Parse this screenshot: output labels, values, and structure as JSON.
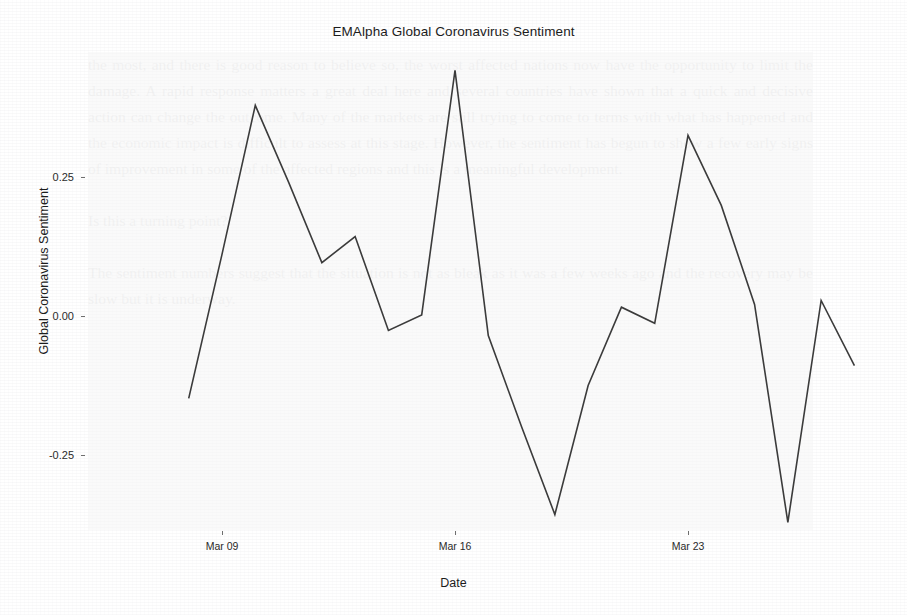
{
  "chart_data": {
    "type": "line",
    "title": "EMAlpha Global Coronavirus Sentiment",
    "xlabel": "Date",
    "ylabel": "Global Coronavirus Sentiment",
    "grid": false,
    "legend": "none",
    "line_color": "#3b3b3b",
    "x_tick_labels": [
      "Mar 09",
      "Mar 16",
      "Mar 23"
    ],
    "y_tick_labels": [
      "0.25",
      "0.00",
      "-0.25"
    ],
    "y_tick_values": [
      0.25,
      0.0,
      -0.25
    ],
    "ylim": [
      -0.43,
      0.49
    ],
    "xlim": [
      "Mar 08",
      "Mar 27"
    ],
    "x": [
      "Mar 08",
      "Mar 09",
      "Mar 10",
      "Mar 11",
      "Mar 12",
      "Mar 13",
      "Mar 14",
      "Mar 15",
      "Mar 16",
      "Mar 17",
      "Mar 18",
      "Mar 19",
      "Mar 20",
      "Mar 21",
      "Mar 22",
      "Mar 23",
      "Mar 24",
      "Mar 25",
      "Mar 26",
      "Mar 27"
    ],
    "values": [
      -0.149,
      0.11,
      0.378,
      0.24,
      0.095,
      0.142,
      -0.027,
      0.001,
      0.441,
      -0.036,
      -0.2,
      -0.358,
      -0.126,
      0.015,
      -0.014,
      0.324,
      0.198,
      0.02,
      -0.372,
      0.027
    ],
    "series": [
      {
        "name": "Global Coronavirus Sentiment",
        "values": [
          -0.149,
          0.11,
          0.378,
          0.24,
          0.095,
          0.142,
          -0.027,
          0.001,
          0.441,
          -0.036,
          -0.2,
          -0.358,
          -0.126,
          0.015,
          -0.014,
          0.324,
          0.198,
          0.02,
          -0.372,
          0.027
        ]
      }
    ],
    "final_point_value": -0.09,
    "point_count": 21
  },
  "background_text": "the most, and there is good reason to believe so, the worst affected nations now have the opportunity to limit the damage. A rapid response matters a great deal here and several countries have shown that a quick and decisive action can change the outcome. Many of the markets are still trying to come to terms with what has happened and the economic impact is difficult to assess at this stage. However, the sentiment has begun to show a few early signs of improvement in some of the affected regions and this is a meaningful development.\n\nIs this a turning point?\n\nThe sentiment numbers suggest that the situation is not as bleak as it was a few weeks ago and the recovery may be slow but it is underway."
}
